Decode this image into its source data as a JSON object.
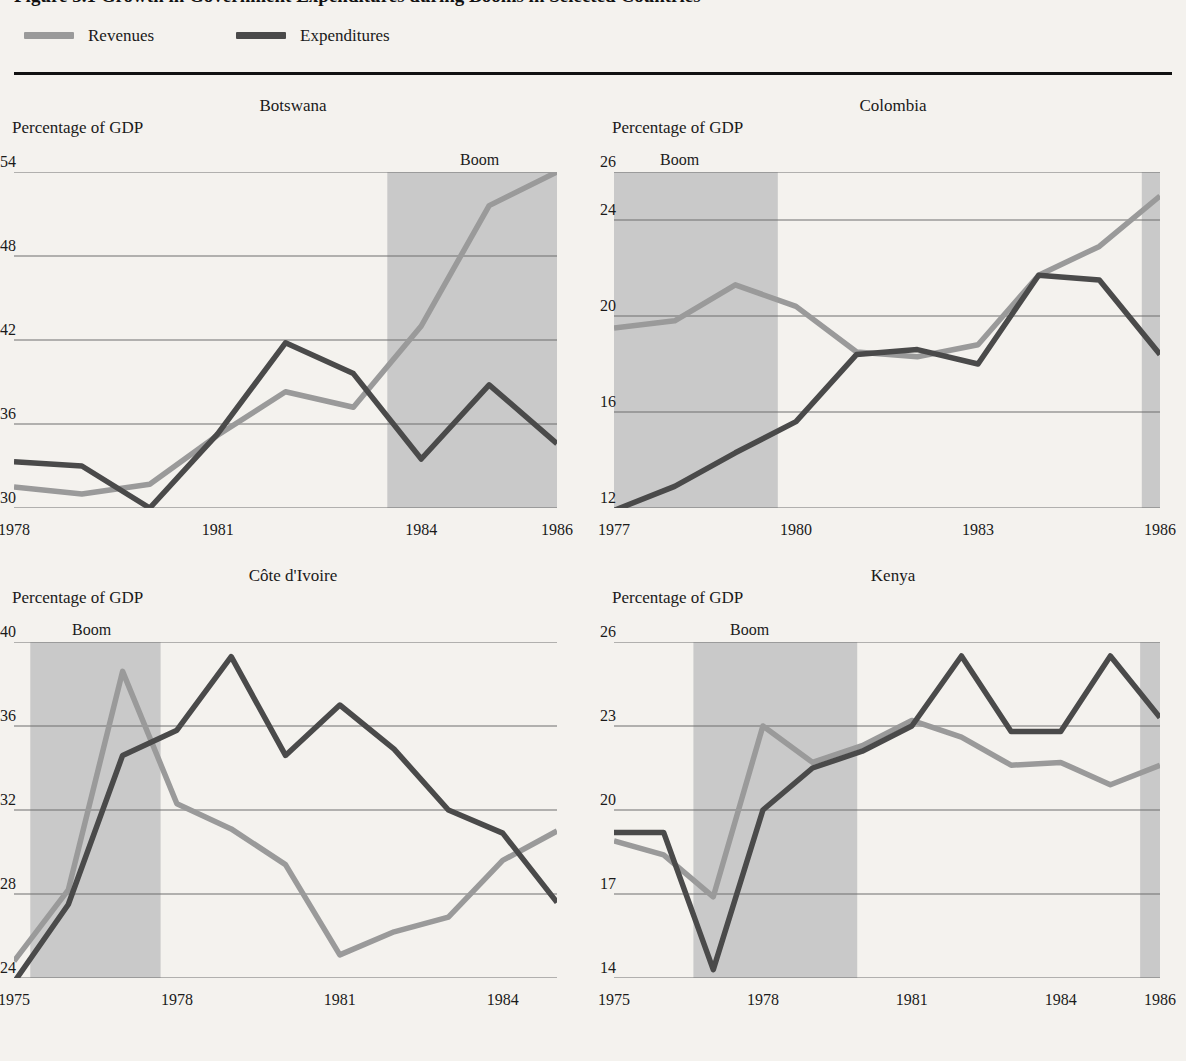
{
  "figure": {
    "title": "Figure 3.1  Growth in Government Expenditures during Booms in Selected Countries",
    "rule_color": "#111111"
  },
  "legend": {
    "items": [
      {
        "label": "Revenues",
        "color": "#9a9a9a",
        "icon": "line-swatch"
      },
      {
        "label": "Expenditures",
        "color": "#4a4a4a",
        "icon": "line-swatch"
      }
    ]
  },
  "colors": {
    "revenues": "#9a9a9a",
    "expenditures": "#4a4a4a",
    "boom_band": "#c9c9c9",
    "gridline": "#6f6f6f",
    "background": "#f4f2ee"
  },
  "boom_label": "Boom",
  "axis_label": "Percentage of GDP",
  "chart_data": [
    {
      "type": "line",
      "title": "Botswana",
      "ylabel": "Percentage of GDP",
      "xlabel": "",
      "ylim": [
        30,
        54
      ],
      "yticks": [
        30,
        36,
        42,
        48,
        54
      ],
      "xlim": [
        1978,
        1986
      ],
      "xticks": [
        1978,
        1981,
        1984,
        1986
      ],
      "x": [
        1978,
        1979,
        1980,
        1981,
        1982,
        1983,
        1984,
        1985,
        1986
      ],
      "grid": true,
      "legend_position": "figure-top",
      "boom_periods": [
        [
          1983.5,
          1986
        ]
      ],
      "series": [
        {
          "name": "Revenues",
          "values": [
            31.5,
            31.0,
            31.7,
            35.2,
            38.3,
            37.2,
            43.0,
            51.6,
            54.0
          ]
        },
        {
          "name": "Expenditures",
          "values": [
            33.3,
            33.0,
            30.0,
            35.3,
            41.8,
            39.6,
            33.5,
            38.8,
            34.6
          ]
        }
      ]
    },
    {
      "type": "line",
      "title": "Colombia",
      "ylabel": "Percentage of GDP",
      "xlabel": "",
      "ylim": [
        12,
        26
      ],
      "yticks": [
        12,
        16,
        20,
        24,
        26
      ],
      "xlim": [
        1977,
        1986
      ],
      "xticks": [
        1977,
        1980,
        1983,
        1986
      ],
      "x": [
        1977,
        1978,
        1979,
        1980,
        1981,
        1982,
        1983,
        1984,
        1985,
        1986
      ],
      "grid": true,
      "legend_position": "figure-top",
      "boom_periods": [
        [
          1977,
          1979.7
        ],
        [
          1985.7,
          1986
        ]
      ],
      "series": [
        {
          "name": "Revenues",
          "values": [
            19.5,
            19.8,
            21.3,
            20.4,
            18.5,
            18.3,
            18.8,
            21.7,
            22.9,
            25.0
          ]
        },
        {
          "name": "Expenditures",
          "values": [
            11.9,
            12.9,
            14.3,
            15.6,
            18.4,
            18.6,
            18.0,
            21.7,
            21.5,
            18.4
          ]
        }
      ]
    },
    {
      "type": "line",
      "title": "Côte d'Ivoire",
      "ylabel": "Percentage of GDP",
      "xlabel": "",
      "ylim": [
        24,
        40
      ],
      "yticks": [
        24,
        28,
        32,
        36,
        40
      ],
      "xlim": [
        1975,
        1985
      ],
      "xticks": [
        1975,
        1978,
        1981,
        1984
      ],
      "x": [
        1975,
        1976,
        1977,
        1978,
        1979,
        1980,
        1981,
        1982,
        1983,
        1984,
        1985
      ],
      "grid": true,
      "legend_position": "figure-top",
      "boom_periods": [
        [
          1975.3,
          1977.7
        ]
      ],
      "series": [
        {
          "name": "Revenues",
          "values": [
            24.8,
            28.2,
            38.6,
            32.3,
            31.1,
            29.4,
            25.1,
            26.2,
            26.9,
            29.6,
            31.0
          ]
        },
        {
          "name": "Expenditures",
          "values": [
            23.8,
            27.5,
            34.6,
            35.8,
            39.3,
            34.6,
            37.0,
            34.9,
            32.0,
            30.9,
            27.6
          ]
        }
      ]
    },
    {
      "type": "line",
      "title": "Kenya",
      "ylabel": "Percentage of GDP",
      "xlabel": "",
      "ylim": [
        14,
        26
      ],
      "yticks": [
        14,
        17,
        20,
        23,
        26
      ],
      "xlim": [
        1975,
        1986
      ],
      "xticks": [
        1975,
        1978,
        1981,
        1984,
        1986
      ],
      "x": [
        1975,
        1976,
        1977,
        1978,
        1979,
        1980,
        1981,
        1982,
        1983,
        1984,
        1985,
        1986
      ],
      "grid": true,
      "legend_position": "figure-top",
      "boom_periods": [
        [
          1976.6,
          1979.9
        ],
        [
          1985.6,
          1986
        ]
      ],
      "series": [
        {
          "name": "Revenues",
          "values": [
            18.9,
            18.4,
            16.9,
            23.0,
            21.7,
            22.3,
            23.2,
            22.6,
            21.6,
            21.7,
            20.9,
            21.6
          ]
        },
        {
          "name": "Expenditures",
          "values": [
            19.2,
            19.2,
            14.3,
            20.0,
            21.5,
            22.1,
            23.0,
            25.5,
            22.8,
            22.8,
            25.5,
            23.3
          ]
        }
      ]
    }
  ]
}
